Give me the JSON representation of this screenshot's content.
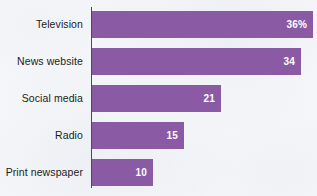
{
  "chart_data": {
    "type": "bar",
    "orientation": "horizontal",
    "title": "",
    "subtitle": "",
    "xlabel": "",
    "ylabel": "",
    "categories": [
      "Television",
      "News website",
      "Social media",
      "Radio",
      "Print newspaper"
    ],
    "values": [
      36,
      34,
      21,
      15,
      10
    ],
    "value_labels": [
      "36%",
      "34",
      "21",
      "15",
      "10"
    ],
    "xlim": [
      0,
      36.5
    ],
    "grid": false,
    "legend": false,
    "bar_color": "#8b5aa5",
    "value_label_color": "#ffffff",
    "category_label_color": "#1d1d20",
    "axis_color": "#4b4b50",
    "background_color": "#f7f8fa"
  },
  "bars": [
    {
      "label": "Television",
      "value_label": "36%",
      "width_px": 221,
      "top_px": 11
    },
    {
      "label": "News website",
      "value_label": "34",
      "width_px": 209,
      "top_px": 48
    },
    {
      "label": "Social media",
      "value_label": "21",
      "width_px": 129,
      "top_px": 85
    },
    {
      "label": "Radio",
      "value_label": "15",
      "width_px": 92,
      "top_px": 122
    },
    {
      "label": "Print newspaper",
      "value_label": "10",
      "width_px": 61,
      "top_px": 159
    }
  ]
}
